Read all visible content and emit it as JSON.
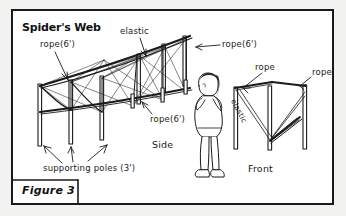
{
  "figure": {
    "title": "Spider's Web",
    "caption": "Figure 3"
  },
  "labels": {
    "rope_left": "rope(6')",
    "elastic_top": "elastic",
    "rope_top_right": "rope(6')",
    "rope_middle": "rope(6')",
    "side_view": "Side",
    "supporting_poles": "supporting poles (3')",
    "front_rope_a": "rope",
    "front_rope_b": "rope",
    "front_elastic": "elastic",
    "front_view": "Front"
  },
  "colors": {
    "ink": "#1a1a1a",
    "paper": "#ffffff",
    "page": "#f2f2f0"
  }
}
